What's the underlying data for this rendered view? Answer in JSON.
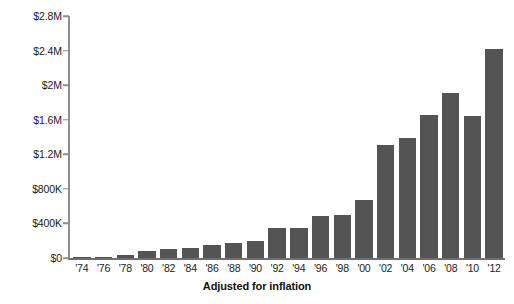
{
  "chart_data": {
    "type": "bar",
    "title": "",
    "subtitle": "",
    "xlabel": "Adjusted for inflation",
    "ylabel": "",
    "categories": [
      "'74",
      "'76",
      "'78",
      "'80",
      "'82",
      "'84",
      "'86",
      "'88",
      "'90",
      "'92",
      "'94",
      "'96",
      "'98",
      "'00",
      "'02",
      "'04",
      "'06",
      "'08",
      "'10",
      "'12"
    ],
    "values": [
      10000,
      15000,
      35000,
      80000,
      105000,
      120000,
      145000,
      175000,
      195000,
      345000,
      350000,
      490000,
      500000,
      670000,
      1310000,
      1390000,
      1660000,
      1910000,
      1640000,
      2420000
    ],
    "value_labels": [
      "$10K",
      "$15K",
      "$35K",
      "$80K",
      "$105K",
      "$120K",
      "$145K",
      "$175K",
      "$195K",
      "$345K",
      "$350K",
      "$490K",
      "$500K",
      "$670K",
      "$1.31M",
      "$1.39M",
      "$1.66M",
      "$1.91M",
      "$1.64M",
      "$2.42M"
    ],
    "ylim": [
      0,
      2800000
    ],
    "ytick_values": [
      0,
      400000,
      800000,
      1200000,
      1600000,
      2000000,
      2400000,
      2800000
    ],
    "ytick_labels": [
      "$0",
      "$400K",
      "$800K",
      "$1.2M",
      "$1.6M",
      "$2M",
      "$2.4M",
      "$2.8M"
    ],
    "grid": false,
    "legend": false,
    "legend_position": "none",
    "bar_color": "#545454",
    "axis_color": "#8e8e8e",
    "background_color": "#ffffff",
    "text_color": "#1b1b1b"
  }
}
